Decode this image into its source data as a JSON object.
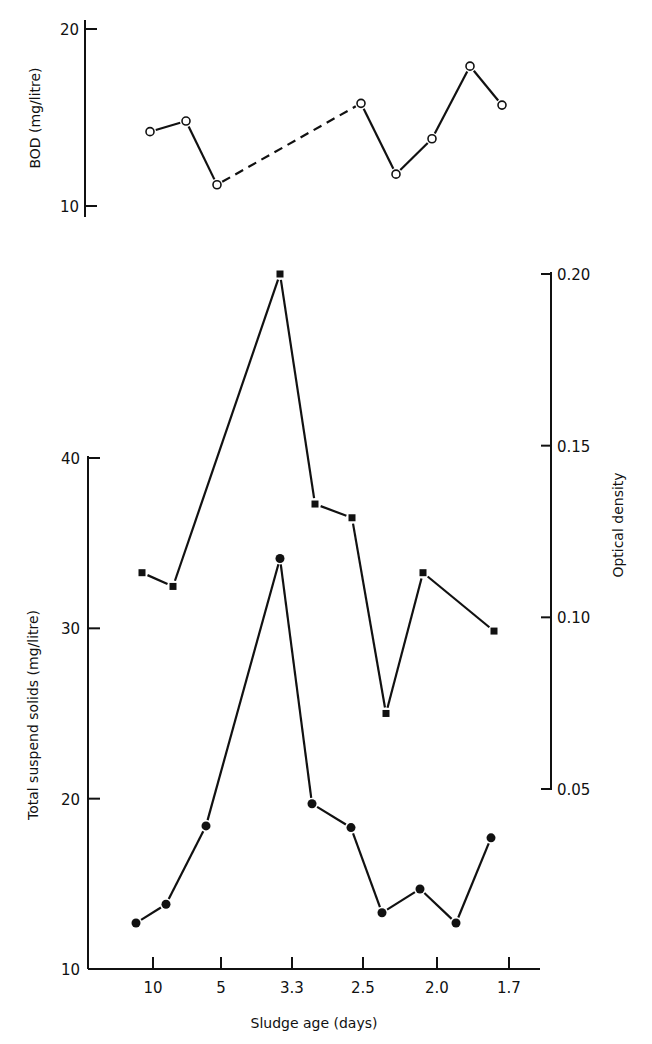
{
  "chart_data": [
    {
      "id": "bod",
      "type": "line",
      "title": "",
      "ylabel": "BOD (mg/litre)",
      "ylim": [
        10,
        20
      ],
      "yticks": [
        10,
        20
      ],
      "grid": false,
      "series": [
        {
          "name": "BOD",
          "marker": "open-circle",
          "x_px": [
            150,
            186,
            217,
            361,
            396,
            432,
            470,
            502
          ],
          "values": [
            14.2,
            14.8,
            11.2,
            15.8,
            11.8,
            13.8,
            17.9,
            15.7
          ],
          "segment_styles": [
            "solid",
            "solid",
            "dashed",
            "solid",
            "solid",
            "solid",
            "solid"
          ]
        }
      ]
    },
    {
      "id": "solids-od",
      "type": "line",
      "title": "",
      "xlabel": "Sludge age (days)",
      "xticks": [
        "10",
        "5",
        "3.3",
        "2.5",
        "2.0",
        "1.7"
      ],
      "xtick_px": [
        153,
        221,
        292,
        363,
        437,
        509
      ],
      "ylabel": "Total suspend solids (mg/litre)",
      "ylim": [
        10,
        40
      ],
      "yticks": [
        10,
        20,
        30,
        40
      ],
      "y2label": "Optical density",
      "y2lim": [
        0.05,
        0.2
      ],
      "y2ticks": [
        "0.05",
        "0.10",
        "0.15",
        "0.20"
      ],
      "grid": false,
      "series": [
        {
          "name": "Total suspend solids",
          "axis": "left",
          "marker": "filled-circle",
          "x_px": [
            136,
            166,
            206,
            280,
            312,
            351,
            382,
            420,
            456,
            491
          ],
          "values": [
            12.7,
            13.8,
            18.4,
            34.1,
            19.7,
            18.3,
            13.3,
            14.7,
            12.7,
            17.7
          ]
        },
        {
          "name": "Optical density",
          "axis": "right",
          "marker": "filled-square",
          "x_px": [
            142,
            173,
            280,
            315,
            352,
            386,
            423,
            494
          ],
          "values": [
            0.113,
            0.109,
            0.2,
            0.133,
            0.129,
            0.072,
            0.113,
            0.096
          ]
        }
      ]
    }
  ],
  "labels": {
    "bod_axis_title": "BOD (mg/litre)",
    "bod_tick_20": "20",
    "bod_tick_10": "10",
    "tss_axis_title": "Total suspend solids (mg/litre)",
    "od_axis_title": "Optical density",
    "x_axis_title": "Sludge age (days)"
  }
}
